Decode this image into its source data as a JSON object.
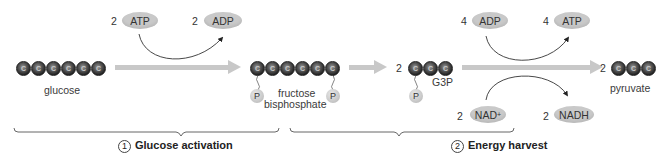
{
  "diagram": {
    "molecules": {
      "glucose": {
        "label": "glucose",
        "carbons": 6,
        "carbon_symbol": "C"
      },
      "fructose_bisphosphate": {
        "label_line1": "fructose",
        "label_line2": "bisphosphate",
        "carbons": 6,
        "phosphates": 2
      },
      "g3p": {
        "coef": "2",
        "label": "G3P",
        "carbons": 3,
        "phosphates": 1
      },
      "pyruvate": {
        "coef": "2",
        "label": "pyruvate",
        "carbons": 3
      }
    },
    "phosphate_symbol": "P",
    "cofactors": {
      "atp_in": {
        "coef": "2",
        "label": "ATP"
      },
      "adp_out": {
        "coef": "2",
        "label": "ADP"
      },
      "adp_in": {
        "coef": "4",
        "label": "ADP"
      },
      "atp_out": {
        "coef": "4",
        "label": "ATP"
      },
      "nad_in": {
        "coef": "2",
        "label": "NAD",
        "superscript": "+"
      },
      "nadh_out": {
        "coef": "2",
        "label": "NADH"
      }
    },
    "stages": [
      {
        "number": "1",
        "label": "Glucose activation"
      },
      {
        "number": "2",
        "label": "Energy harvest"
      }
    ],
    "colors": {
      "carbon": "#2a2a2a",
      "pill": "#c9c9c9",
      "arrow": "#c8c8c8",
      "bracket": "#555555"
    }
  }
}
